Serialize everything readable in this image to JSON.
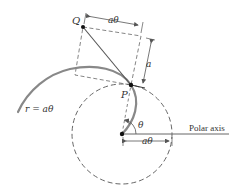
{
  "diagram": {
    "type": "polar-spiral-geometry",
    "colors": {
      "curve": "#808080",
      "line": "#555555",
      "dashed": "#666666",
      "point": "#111111",
      "text": "#333333"
    },
    "labels": {
      "point_q": "Q",
      "point_p": "P",
      "top_dimension": "aθ",
      "side_dimension": "a",
      "spiral_equation": "r = aθ",
      "angle": "θ",
      "bottom_dimension": "aθ",
      "axis": "Polar axis"
    },
    "geometry": {
      "origin": [
        122,
        134
      ],
      "circle_radius": 50,
      "point_p": [
        131,
        85
      ],
      "point_q": [
        83,
        27
      ]
    }
  }
}
